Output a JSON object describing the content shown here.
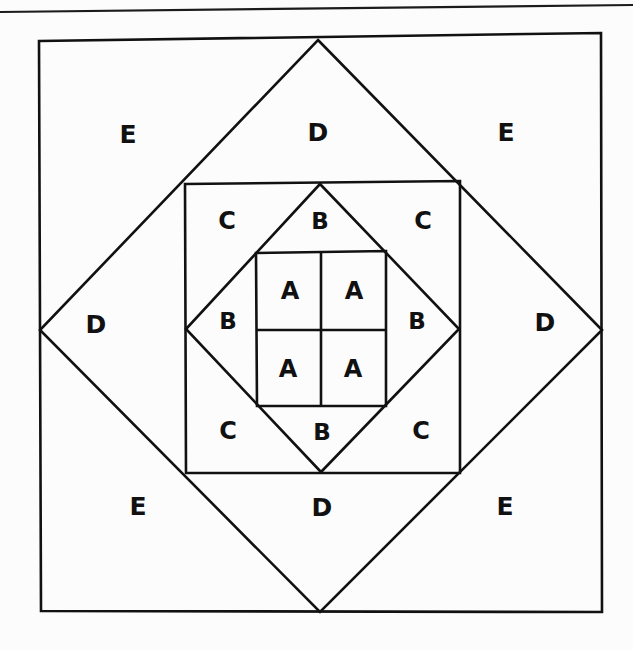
{
  "page": {
    "background_color": "#fcfcfc",
    "ink_color": "#111111",
    "width": 633,
    "height": 650
  },
  "rule": {
    "name": "horizontal-rule",
    "x1": 0,
    "y1": 12,
    "x2": 633,
    "y2": 5,
    "stroke_width": 2.2
  },
  "figure": {
    "outer_square": {
      "x": 39,
      "y": 40,
      "w": 563,
      "h": 572
    },
    "outer_diamond": {
      "top": {
        "x": 318,
        "y": 40
      },
      "right": {
        "x": 602,
        "y": 330
      },
      "bottom": {
        "x": 320,
        "y": 612
      },
      "left": {
        "x": 40,
        "y": 330
      }
    },
    "middle_square": {
      "x": 185,
      "y": 183,
      "w": 275,
      "h": 290
    },
    "middle_diamond": {
      "top": {
        "x": 320,
        "y": 184
      },
      "right": {
        "x": 459,
        "y": 329
      },
      "bottom": {
        "x": 321,
        "y": 472
      },
      "left": {
        "x": 186,
        "y": 329
      }
    },
    "inner_square": {
      "x": 256,
      "y": 252,
      "w": 130,
      "h": 154
    },
    "inner_grid": {
      "vertical_divider_x": 321,
      "horizontal_divider_y": 330
    }
  },
  "labels": {
    "region_e": [
      {
        "text": "E",
        "x": 128,
        "y": 136
      },
      {
        "text": "E",
        "x": 506,
        "y": 134
      },
      {
        "text": "E",
        "x": 138,
        "y": 508
      },
      {
        "text": "E",
        "x": 505,
        "y": 508
      }
    ],
    "region_d": [
      {
        "text": "D",
        "x": 318,
        "y": 134
      },
      {
        "text": "D",
        "x": 545,
        "y": 324
      },
      {
        "text": "D",
        "x": 322,
        "y": 509
      },
      {
        "text": "D",
        "x": 96,
        "y": 326
      }
    ],
    "region_c": [
      {
        "text": "C",
        "x": 227,
        "y": 222
      },
      {
        "text": "C",
        "x": 423,
        "y": 222
      },
      {
        "text": "C",
        "x": 228,
        "y": 432
      },
      {
        "text": "C",
        "x": 421,
        "y": 432
      }
    ],
    "region_b": [
      {
        "text": "B",
        "x": 320,
        "y": 222
      },
      {
        "text": "B",
        "x": 417,
        "y": 322
      },
      {
        "text": "B",
        "x": 322,
        "y": 433
      },
      {
        "text": "B",
        "x": 228,
        "y": 322
      }
    ],
    "region_a": [
      {
        "text": "A",
        "x": 290,
        "y": 292
      },
      {
        "text": "A",
        "x": 354,
        "y": 292
      },
      {
        "text": "A",
        "x": 288,
        "y": 370
      },
      {
        "text": "A",
        "x": 353,
        "y": 370
      }
    ]
  }
}
